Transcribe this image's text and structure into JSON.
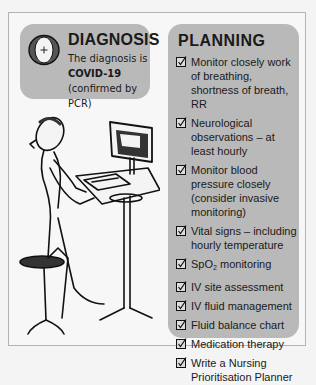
{
  "diagnosis": {
    "icon": "diagnosis-icon",
    "title": "DIAGNOSIS",
    "text_prefix": "The diagnosis is",
    "text_bold": "COVID-19",
    "text_suffix": "(confirmed by PCR)"
  },
  "planning": {
    "title": "PLANNING",
    "checkbox_icon": "checked-box-icon",
    "items": [
      {
        "label": "Monitor closely work of breathing, shortness of breath, RR"
      },
      {
        "label": "Neurological observations – at least hourly"
      },
      {
        "label": "Monitor blood pressure closely (consider invasive monitoring)"
      },
      {
        "label": "Vital signs – including hourly temperature"
      },
      {
        "label_prefix": "SpO",
        "label_sub": "2",
        "label_suffix": " monitoring"
      },
      {
        "label": "IV site assessment"
      },
      {
        "label": "IV fluid management"
      },
      {
        "label": "Fluid balance chart"
      },
      {
        "label": "Medication therapy"
      },
      {
        "label": "Write a Nursing Prioritisation Planner"
      }
    ]
  },
  "illustration": {
    "icon": "person-at-computer-illustration"
  },
  "colors": {
    "panel_bg": "#b9b9b9",
    "page_bg": "#f7f7f7",
    "border": "#b4b4b4"
  }
}
